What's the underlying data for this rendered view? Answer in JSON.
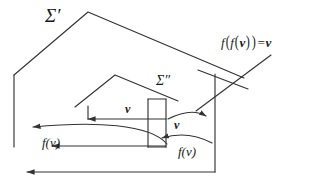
{
  "figure": {
    "type": "geometric-diagram",
    "background_color": "#ffffff",
    "stroke_color": "#333333",
    "labels": {
      "outer_surface": "Σ′",
      "inner_surface": "Σ″",
      "vector_top": "v",
      "vector_inner": "v",
      "map_left_curved": "f(v)",
      "map_left_straight": "f(v)",
      "map_right_curved": "f(v)",
      "involution_formula_f": "f",
      "involution_formula_inner": "f",
      "involution_formula_arg": "v",
      "involution_formula_eq": "=",
      "involution_formula_result": "v"
    },
    "formula_plain": "f(f(v)) = v",
    "geometry": {
      "outer_polygon_points": "14,75 88,12 244,78 215,78 215,172",
      "outer_left_vertical": "14,75 14,147",
      "inner_polygon_points": "88,105 115,75 175,100",
      "inner_left_tick": "88,105 99,93",
      "pointer_line": "275,58 196,110",
      "cross_edge": "198,72 244,90",
      "bottom_arrow": "215,172 27,172",
      "arrow_v_top": "166,119 85,119",
      "arrow_stem_v_top": "166,100 166,119",
      "arrow_fv_mid_straight": "166,146 52,146",
      "arrow_stem_fv_mid": "166,119 166,146"
    }
  }
}
